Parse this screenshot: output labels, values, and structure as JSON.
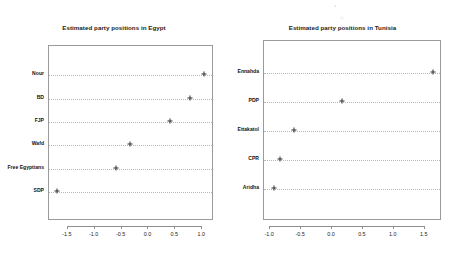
{
  "chart_data": [
    {
      "type": "scatter",
      "title": "Estimated party positions in Egypt",
      "xlabel": "",
      "ylabel": "",
      "orientation": "horizontal",
      "marker": "plus",
      "grid": true,
      "grid_style": "dotted-horizontal",
      "legend": "none",
      "xlim": [
        -1.85,
        1.22
      ],
      "xticks": [
        -1.5,
        -1.0,
        -0.5,
        0.0,
        0.5,
        1.0
      ],
      "xticklabels": [
        "-1.5",
        "-1.0",
        "-0.5",
        "0.0",
        "0.5",
        "1.0"
      ],
      "categories": [
        "Nour",
        "BD",
        "FJP",
        "Wafd",
        "Free Egyptians",
        "SDP"
      ],
      "values": [
        1.05,
        0.8,
        0.42,
        -0.33,
        -0.58,
        -1.68
      ],
      "points": [
        {
          "label": "Nour",
          "value": 1.05
        },
        {
          "label": "BD",
          "value": 0.8
        },
        {
          "label": "FJP",
          "value": 0.42
        },
        {
          "label": "Wafd",
          "value": -0.33
        },
        {
          "label": "Free Egyptians",
          "value": -0.58
        },
        {
          "label": "SDP",
          "value": -1.68
        }
      ]
    },
    {
      "type": "scatter",
      "title": "Estimated party positions in Tunisia",
      "xlabel": "",
      "ylabel": "",
      "orientation": "horizontal",
      "marker": "plus",
      "grid": true,
      "grid_style": "dotted-horizontal",
      "legend": "none",
      "xlim": [
        -1.1,
        1.78
      ],
      "xticks": [
        -1.0,
        -0.5,
        0.0,
        0.5,
        1.0,
        1.5
      ],
      "xticklabels": [
        "-1.0",
        "-0.5",
        "0.0",
        "0.5",
        "1.0",
        "1.5"
      ],
      "categories": [
        "Ennahda",
        "PDP",
        "Ettakatol",
        "CPR",
        "Aridha"
      ],
      "values": [
        1.65,
        0.18,
        -0.6,
        -0.82,
        -0.93
      ],
      "points": [
        {
          "label": "Ennahda",
          "value": 1.65
        },
        {
          "label": "PDP",
          "value": 0.18
        },
        {
          "label": "Ettakatol",
          "value": -0.6
        },
        {
          "label": "CPR",
          "value": -0.82
        },
        {
          "label": "Aridha",
          "value": -0.93
        }
      ]
    }
  ],
  "colors": {
    "marker": "#2b2b2b",
    "gridline": "#b8b8b8",
    "axis": "#8f8f8f",
    "text": "#111111",
    "background": "#ffffff"
  },
  "artifacts": [
    "°",
    "○"
  ]
}
